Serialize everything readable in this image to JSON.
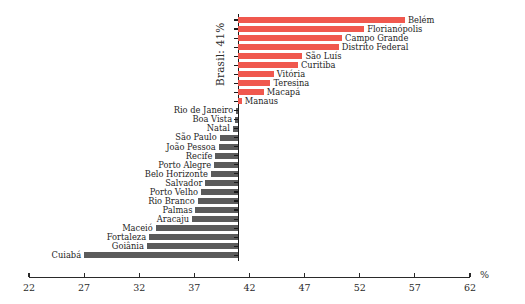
{
  "chart_data": {
    "type": "bar",
    "orientation": "horizontal",
    "title": "",
    "subtitle": "",
    "xlabel": "%",
    "ylabel": "Brasil: 41%",
    "xlim": [
      22,
      62
    ],
    "xticks": [
      22,
      27,
      32,
      37,
      42,
      47,
      52,
      57,
      62
    ],
    "xtick_labels": [
      "22",
      "27",
      "32",
      "37",
      "42",
      "47",
      "52",
      "57",
      "62"
    ],
    "baseline_value": 41,
    "baseline_label": "Brasil: 41%",
    "grid": false,
    "legend": "none",
    "colors": {
      "above_average": "#f0584e",
      "below_average": "#5b5b5b",
      "axis": "#2a2a2a",
      "text": "#242424",
      "background": "#ffffff"
    },
    "categories": [
      "Belém",
      "Florianópolis",
      "Campo Grande",
      "Distrito Federal",
      "São Luís",
      "Curitiba",
      "Vitória",
      "Teresina",
      "Macapá",
      "Manaus",
      "Rio de Janeiro",
      "Boa Vista",
      "Natal",
      "São Paulo",
      "João Pessoa",
      "Recife",
      "Porto Alegre",
      "Belo Horizonte",
      "Salvador",
      "Porto Velho",
      "Rio Branco",
      "Palmas",
      "Aracaju",
      "Maceió",
      "Fortaleza",
      "Goiânia",
      "Cuiabá"
    ],
    "values": [
      56.1,
      52.4,
      50.4,
      50.1,
      46.8,
      46.4,
      44.2,
      43.9,
      43.3,
      41.3,
      40.8,
      40.7,
      40.5,
      39.3,
      39.2,
      38.9,
      38.8,
      38.5,
      38.0,
      37.6,
      37.3,
      37.1,
      36.8,
      33.5,
      32.9,
      32.7,
      27.0
    ],
    "bars": [
      {
        "label": "Belém",
        "value": 56.1,
        "side": "above"
      },
      {
        "label": "Florianópolis",
        "value": 52.4,
        "side": "above"
      },
      {
        "label": "Campo Grande",
        "value": 50.4,
        "side": "above"
      },
      {
        "label": "Distrito Federal",
        "value": 50.1,
        "side": "above"
      },
      {
        "label": "São Luís",
        "value": 46.8,
        "side": "above"
      },
      {
        "label": "Curitiba",
        "value": 46.4,
        "side": "above"
      },
      {
        "label": "Vitória",
        "value": 44.2,
        "side": "above"
      },
      {
        "label": "Teresina",
        "value": 43.9,
        "side": "above"
      },
      {
        "label": "Macapá",
        "value": 43.3,
        "side": "above"
      },
      {
        "label": "Manaus",
        "value": 41.3,
        "side": "above"
      },
      {
        "label": "Rio de Janeiro",
        "value": 40.8,
        "side": "below"
      },
      {
        "label": "Boa Vista",
        "value": 40.7,
        "side": "below"
      },
      {
        "label": "Natal",
        "value": 40.5,
        "side": "below"
      },
      {
        "label": "São Paulo",
        "value": 39.3,
        "side": "below"
      },
      {
        "label": "João Pessoa",
        "value": 39.2,
        "side": "below"
      },
      {
        "label": "Recife",
        "value": 38.9,
        "side": "below"
      },
      {
        "label": "Porto Alegre",
        "value": 38.8,
        "side": "below"
      },
      {
        "label": "Belo Horizonte",
        "value": 38.5,
        "side": "below"
      },
      {
        "label": "Salvador",
        "value": 38.0,
        "side": "below"
      },
      {
        "label": "Porto Velho",
        "value": 37.6,
        "side": "below"
      },
      {
        "label": "Rio Branco",
        "value": 37.3,
        "side": "below"
      },
      {
        "label": "Palmas",
        "value": 37.1,
        "side": "below"
      },
      {
        "label": "Aracaju",
        "value": 36.8,
        "side": "below"
      },
      {
        "label": "Maceió",
        "value": 33.5,
        "side": "below"
      },
      {
        "label": "Fortaleza",
        "value": 32.9,
        "side": "below"
      },
      {
        "label": "Goiânia",
        "value": 32.7,
        "side": "below"
      },
      {
        "label": "Cuiabá",
        "value": 27.0,
        "side": "below"
      }
    ]
  },
  "layout": {
    "plot_left_px": 29,
    "plot_right_px": 470,
    "baseline_px": 243.5,
    "first_row_y_px": 17,
    "row_pitch_px": 9.05,
    "bar_height_px": 6,
    "xaxis_y_px": 277
  }
}
